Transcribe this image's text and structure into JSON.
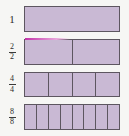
{
  "diagram": {
    "background_color": "#f6f6f4",
    "bar_fill_color": "#c9b9d4",
    "bar_border_color": "#5d5660",
    "highlight_color": "#c233a8",
    "rows": [
      {
        "label_type": "whole",
        "label": "1",
        "numerator": "1",
        "denominator": "1",
        "parts": 1,
        "top": 6,
        "left": 24,
        "width": 96,
        "height": 26,
        "highlight": false
      },
      {
        "label_type": "fraction",
        "label": "2/2",
        "numerator": "2",
        "denominator": "2",
        "parts": 2,
        "top": 39,
        "left": 24,
        "width": 96,
        "height": 26,
        "highlight": true
      },
      {
        "label_type": "fraction",
        "label": "4/4",
        "numerator": "4",
        "denominator": "4",
        "parts": 4,
        "top": 72,
        "left": 24,
        "width": 96,
        "height": 25,
        "highlight": false
      },
      {
        "label_type": "fraction",
        "label": "8/8",
        "numerator": "8",
        "denominator": "8",
        "parts": 8,
        "top": 104,
        "left": 24,
        "width": 96,
        "height": 26,
        "highlight": false
      }
    ]
  }
}
